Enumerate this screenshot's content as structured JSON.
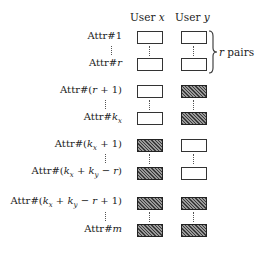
{
  "columns": [
    {
      "label": "User ",
      "var": "x"
    },
    {
      "label": "User ",
      "var": "y"
    }
  ],
  "brace": {
    "var": "r",
    "text": " pairs"
  },
  "rows": [
    {
      "label_prefix": "Attr#",
      "label_expr": "1",
      "x_hatched": false,
      "y_hatched": false
    },
    {
      "label_prefix": "Attr#",
      "label_expr": "r",
      "x_hatched": false,
      "y_hatched": false
    },
    {
      "label_prefix": "Attr#",
      "label_expr": "(r + 1)",
      "x_hatched": false,
      "y_hatched": true
    },
    {
      "label_prefix": "Attr#",
      "label_expr": "k_x",
      "x_hatched": false,
      "y_hatched": true
    },
    {
      "label_prefix": "Attr#",
      "label_expr": "(k_x + 1)",
      "x_hatched": true,
      "y_hatched": false
    },
    {
      "label_prefix": "Attr#",
      "label_expr": "(k_x + k_y − r)",
      "x_hatched": true,
      "y_hatched": false
    },
    {
      "label_prefix": "Attr#",
      "label_expr": "(k_x + k_y − r + 1)",
      "x_hatched": true,
      "y_hatched": true
    },
    {
      "label_prefix": "Attr#",
      "label_expr": "m",
      "x_hatched": true,
      "y_hatched": true
    }
  ],
  "groups": [
    {
      "name": "shared",
      "rows": [
        0,
        1
      ],
      "x": "empty",
      "y": "empty"
    },
    {
      "name": "y-only",
      "rows": [
        2,
        3
      ],
      "x": "empty",
      "y": "hatched"
    },
    {
      "name": "x-only",
      "rows": [
        4,
        5
      ],
      "x": "hatched",
      "y": "empty"
    },
    {
      "name": "neither",
      "rows": [
        6,
        7
      ],
      "x": "hatched",
      "y": "hatched"
    }
  ],
  "ellipsis": "⋮",
  "colors": {
    "border": "#333333",
    "hatch_dark": "#3a3a3a",
    "hatch_light": "#9a9a9a",
    "background": "#ffffff"
  }
}
